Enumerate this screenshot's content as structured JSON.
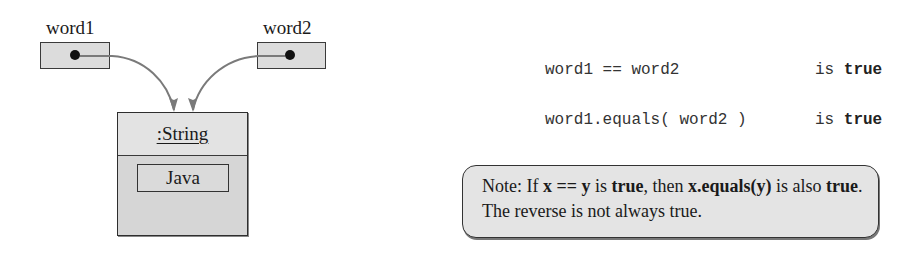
{
  "diagram": {
    "variables": [
      {
        "name": "word1"
      },
      {
        "name": "word2"
      }
    ],
    "object": {
      "title": ":String",
      "value": "Java"
    }
  },
  "comparisons": [
    {
      "expression": "word1 == word2",
      "is_label": "is",
      "result": "true"
    },
    {
      "expression": "word1.equals( word2 )",
      "is_label": "is",
      "result": "true"
    }
  ],
  "note": {
    "prefix": "Note: If ",
    "expr1": "x == y",
    "mid1": " is ",
    "true1": "true",
    "mid2": ", then ",
    "expr2": "x.equals(y)",
    "mid3": " is also ",
    "true2": "true",
    "suffix": ". The reverse is not always true."
  },
  "colors": {
    "box_fill": "#dcdcdc",
    "object_fill": "#d6d6d6",
    "arrow": "#7a7a7a",
    "note_fill": "#e4e4e4"
  }
}
